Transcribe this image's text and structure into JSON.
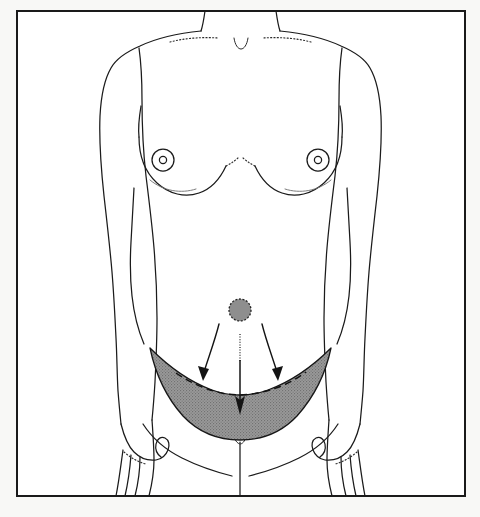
{
  "figure": {
    "title": "Abdominoplasty resection pattern, anterior female torso",
    "caption": "",
    "colors": {
      "outline": "#1b1b1b",
      "resection_shading": "#8e8e8e",
      "page_background": "#f8f8f6",
      "panel_background": "#ffffff",
      "frame_border": "#1a1a1a"
    },
    "frame": {
      "x": 16,
      "y": 10,
      "width": 450,
      "height": 487
    }
  },
  "anatomy": {
    "labels": {
      "neck": "neck",
      "shoulder_left": "left shoulder",
      "shoulder_right": "right shoulder",
      "clavicle_left": "left clavicle",
      "clavicle_right": "right clavicle",
      "sternal_notch": "sternal notch",
      "breast_left": "left breast",
      "breast_right": "right breast",
      "areola_left": "left areola",
      "areola_right": "right areola",
      "nipple_left": "left nipple",
      "nipple_right": "right nipple",
      "arm_left": "left arm",
      "arm_right": "right arm",
      "hand_left": "left hand",
      "hand_right": "right hand",
      "torso": "torso",
      "umbilicus": "umbilicus",
      "pubic_midline": "pubic midline",
      "resection_area": "resection area"
    }
  },
  "markings": {
    "resection": {
      "name": "shaded resection crescent",
      "fill_color": "#8e8e8e",
      "upper_border_style": "solid",
      "incision_line_style": "dashed",
      "left_tip": [
        150,
        348
      ],
      "right_tip": [
        331,
        348
      ],
      "lowest_point": [
        240,
        438
      ]
    },
    "arrows": [
      {
        "name": "left-traction-arrow",
        "from": [
          218,
          324
        ],
        "to": [
          205,
          379
        ],
        "style": "curved"
      },
      {
        "name": "center-traction-arrow",
        "from": [
          240,
          332
        ],
        "to": [
          240,
          414
        ],
        "style": "straight-dotted-shaft"
      },
      {
        "name": "right-traction-arrow",
        "from": [
          262,
          324
        ],
        "to": [
          277,
          379
        ],
        "style": "curved"
      }
    ],
    "umbilicus": {
      "name": "umbilicus",
      "center": [
        240,
        310
      ],
      "radius": 11,
      "fill": "#8e8e8e",
      "ring_style": "dashed"
    },
    "dotted_guides": [
      {
        "name": "clavicle-left-dotted-line"
      },
      {
        "name": "clavicle-right-dotted-line"
      },
      {
        "name": "breast-crease-left-dotted"
      },
      {
        "name": "breast-crease-right-dotted"
      },
      {
        "name": "finger-crease-dotted"
      }
    ]
  }
}
